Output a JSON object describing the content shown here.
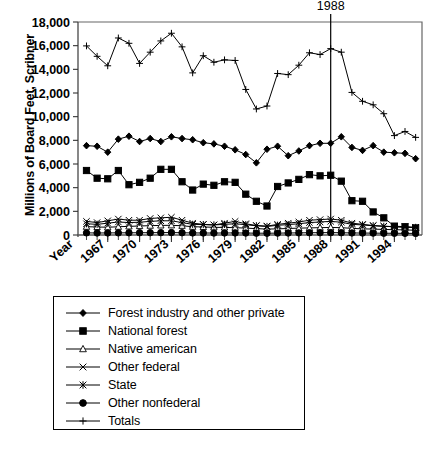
{
  "chart_data": {
    "type": "line",
    "title": "",
    "xlabel": "Year",
    "ylabel": "Millions of Board Feet, Scribner",
    "ylim": [
      0,
      18000
    ],
    "ytick_labels": [
      "0",
      "2,000",
      "4,000",
      "6,000",
      "8,000",
      "10,000",
      "12,000",
      "14,000",
      "16,000",
      "18,000"
    ],
    "ytick_values": [
      0,
      2000,
      4000,
      6000,
      8000,
      10000,
      12000,
      14000,
      16000,
      18000
    ],
    "grid": false,
    "legend_position": "below-plot",
    "x": [
      1965,
      1966,
      1967,
      1968,
      1969,
      1970,
      1971,
      1972,
      1973,
      1974,
      1975,
      1976,
      1977,
      1978,
      1979,
      1980,
      1981,
      1982,
      1983,
      1984,
      1985,
      1986,
      1987,
      1988,
      1989,
      1990,
      1991,
      1992,
      1993,
      1994,
      1995,
      1996
    ],
    "xtick_labels": [
      "Year",
      "1967",
      "1970",
      "1973",
      "1976",
      "1979",
      "1982",
      "1985",
      "1988",
      "1991",
      "1994"
    ],
    "xtick_values": [
      1964,
      1967,
      1970,
      1973,
      1976,
      1979,
      1982,
      1985,
      1988,
      1991,
      1994
    ],
    "annotations": [
      {
        "label": "1988",
        "x": 1988,
        "type": "vertical-reference-line"
      }
    ],
    "series": [
      {
        "name": "Forest industry and other private",
        "marker": "filled-diamond",
        "values": [
          7550,
          7500,
          7000,
          8100,
          8350,
          7900,
          8150,
          7900,
          8300,
          8150,
          8050,
          7800,
          7700,
          7500,
          7200,
          6800,
          6100,
          7250,
          7500,
          6700,
          7100,
          7550,
          7750,
          7750,
          8300,
          7400,
          7150,
          7550,
          7000,
          6950,
          6900,
          6450
        ]
      },
      {
        "name": "National forest",
        "marker": "filled-square",
        "values": [
          5450,
          4800,
          4750,
          5450,
          4250,
          4450,
          4800,
          5550,
          5550,
          4500,
          3800,
          4300,
          4200,
          4500,
          4450,
          3450,
          2850,
          2450,
          4100,
          4400,
          4700,
          5100,
          5000,
          5050,
          4550,
          2900,
          2850,
          1950,
          1450,
          750,
          700,
          600
        ]
      },
      {
        "name": "Native american",
        "marker": "open-triangle",
        "values": [
          700,
          680,
          650,
          700,
          730,
          760,
          790,
          810,
          820,
          780,
          700,
          680,
          650,
          640,
          620,
          580,
          540,
          500,
          520,
          550,
          580,
          600,
          620,
          640,
          620,
          560,
          520,
          500,
          470,
          450,
          430,
          400
        ]
      },
      {
        "name": "Other federal",
        "marker": "x-mark",
        "values": [
          1150,
          1050,
          1200,
          1350,
          1250,
          1250,
          1400,
          1450,
          1500,
          1250,
          1000,
          900,
          850,
          1000,
          1150,
          950,
          800,
          750,
          900,
          1000,
          1100,
          1250,
          1300,
          1350,
          1250,
          1000,
          900,
          800,
          750,
          700,
          680,
          650
        ]
      },
      {
        "name": "State",
        "marker": "asterisk",
        "values": [
          950,
          900,
          1000,
          1100,
          1050,
          1080,
          1150,
          1200,
          1200,
          1050,
          900,
          880,
          850,
          900,
          950,
          870,
          780,
          720,
          820,
          880,
          950,
          1050,
          1100,
          1150,
          1080,
          900,
          850,
          780,
          730,
          700,
          660,
          640
        ]
      },
      {
        "name": "Other nonfederal",
        "marker": "filled-circle",
        "values": [
          180,
          170,
          175,
          180,
          185,
          190,
          195,
          200,
          205,
          190,
          175,
          170,
          165,
          170,
          175,
          165,
          155,
          150,
          160,
          170,
          180,
          190,
          195,
          200,
          190,
          175,
          165,
          160,
          150,
          145,
          140,
          135
        ]
      },
      {
        "name": "Totals",
        "marker": "plus",
        "values": [
          15980,
          15100,
          14300,
          16650,
          16200,
          14500,
          15450,
          16400,
          17050,
          15900,
          13700,
          15150,
          14600,
          14800,
          14750,
          12300,
          10650,
          10900,
          13650,
          13550,
          14350,
          15400,
          15250,
          15750,
          15450,
          12050,
          11300,
          11000,
          10250,
          8400,
          8750,
          8250
        ]
      }
    ]
  }
}
